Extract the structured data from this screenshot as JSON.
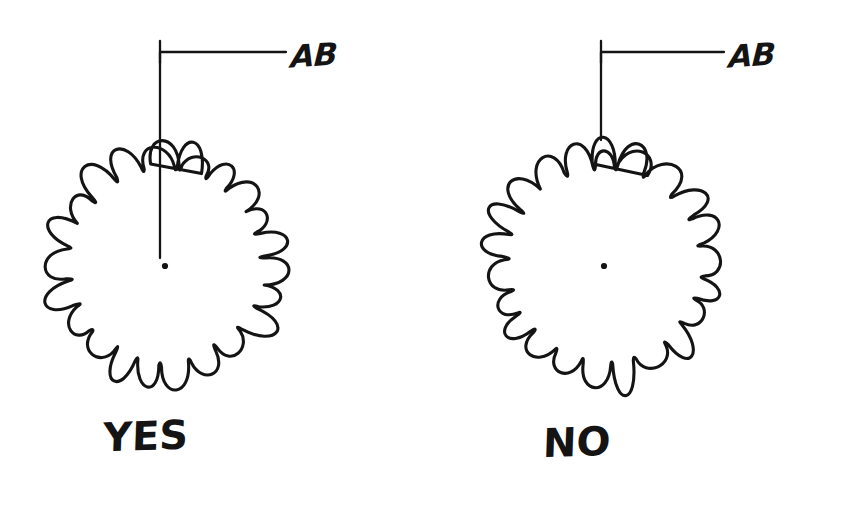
{
  "document": {
    "type": "hand-drawn-diagram",
    "subject": "leader line termination convention for a coil / spring element",
    "background_color": "#ffffff",
    "ink_color": "#141414",
    "width": 851,
    "height": 526
  },
  "figures": [
    {
      "id": "left",
      "verdict_label": "YES",
      "leader_label": "AB",
      "leader_terminates_at": "center point",
      "center_dot_visible": true,
      "leader": {
        "corner_x": 160,
        "corner_y": 52,
        "horizontal_end_x": 286,
        "vertical_end_y": 258,
        "tick_top_y": 41,
        "tick_bottom_y": 63
      },
      "coil": {
        "center_x": 165,
        "center_y": 265,
        "inner_radius": 100,
        "loop_count": 24,
        "loop_height": 26
      },
      "center_dot": {
        "x": 165,
        "y": 266,
        "r": 3.1
      }
    },
    {
      "id": "right",
      "verdict_label": "NO",
      "leader_label": "AB",
      "leader_terminates_at": "outer edge of coil",
      "center_dot_visible": true,
      "leader": {
        "corner_x": 601,
        "corner_y": 52,
        "horizontal_end_x": 724,
        "vertical_end_y": 140,
        "tick_top_y": 41,
        "tick_bottom_y": 63
      },
      "coil": {
        "center_x": 604,
        "center_y": 265,
        "inner_radius": 100,
        "loop_count": 24,
        "loop_height": 26
      },
      "center_dot": {
        "x": 604,
        "y": 266,
        "r": 3.1
      }
    }
  ]
}
